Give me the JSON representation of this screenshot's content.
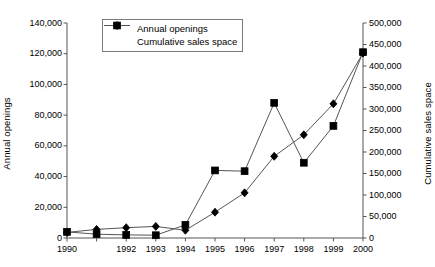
{
  "chart_data": {
    "type": "line",
    "title": "",
    "xlabel": "",
    "ylabel": "Annual openings",
    "y2label": "Cumulative sales space",
    "grid": false,
    "legend_position": "top-left-inside",
    "x": [
      1990,
      1991,
      1992,
      1993,
      1994,
      1995,
      1996,
      1997,
      1998,
      1999,
      2000
    ],
    "xtick_labels": [
      "1990",
      "1992",
      "1993",
      "1994",
      "1995",
      "1996",
      "1997",
      "1998",
      "1999",
      "2000"
    ],
    "xtick_values": [
      1990,
      1992,
      1993,
      1994,
      1995,
      1996,
      1997,
      1998,
      1999,
      2000
    ],
    "ylim": [
      0,
      140000
    ],
    "ytick_values": [
      0,
      20000,
      40000,
      60000,
      80000,
      100000,
      120000,
      140000
    ],
    "ytick_labels": [
      "0",
      "20,000",
      "40,000",
      "60,000",
      "80,000",
      "100,000",
      "120,000",
      "140,000"
    ],
    "y2lim": [
      0,
      500000
    ],
    "y2tick_values": [
      0,
      50000,
      100000,
      150000,
      200000,
      250000,
      300000,
      350000,
      400000,
      450000,
      500000
    ],
    "y2tick_labels": [
      "0",
      "50,000",
      "100,000",
      "150,000",
      "200,000",
      "250,000",
      "300,000",
      "350,000",
      "400,000",
      "450,000",
      "500,000"
    ],
    "series": [
      {
        "name": "Annual openings",
        "axis": "left",
        "marker": "square",
        "color": "#000000",
        "values": [
          4000,
          2500,
          2000,
          1800,
          8500,
          44000,
          43500,
          88000,
          49000,
          73000,
          121000
        ]
      },
      {
        "name": "Cumulative sales space",
        "axis": "right",
        "marker": "diamond",
        "color": "#000000",
        "values": [
          13000,
          20000,
          24000,
          27000,
          18000,
          60000,
          105000,
          190000,
          240000,
          312000,
          430000
        ]
      }
    ]
  },
  "legend": {
    "items": [
      {
        "label": "Annual openings",
        "marker": "square"
      },
      {
        "label": "Cumulative sales space",
        "marker": "diamond"
      }
    ]
  },
  "axes": {
    "left_title": "Annual openings",
    "right_title": "Cumulative sales space"
  }
}
